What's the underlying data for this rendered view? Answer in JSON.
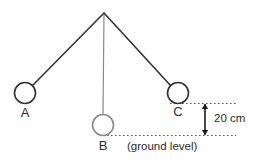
{
  "figure": {
    "background_color": "#ffffff",
    "width": 259,
    "height": 165
  },
  "pivot": {
    "name": "pivot-point",
    "x": 104,
    "y": 13
  },
  "balls": [
    {
      "id": "A",
      "label": "A",
      "cx": 25,
      "cy": 93,
      "r": 10.5,
      "stroke_color": "#333333",
      "fill_color": "#ffffff",
      "label_x": 25,
      "label_y": 114
    },
    {
      "id": "B",
      "label": "B",
      "cx": 103,
      "cy": 125,
      "r": 10.5,
      "stroke_color": "#8a8a8a",
      "fill_color": "#ffffff",
      "label_x": 103,
      "label_y": 147
    },
    {
      "id": "C",
      "label": "C",
      "cx": 178,
      "cy": 93,
      "r": 10.5,
      "stroke_color": "#333333",
      "fill_color": "#ffffff",
      "label_x": 178,
      "label_y": 113
    }
  ],
  "strings": [
    {
      "id": "string-to-A",
      "x1": 104,
      "y1": 13,
      "x2": 32.5,
      "y2": 85.5,
      "stroke_color": "#333333",
      "stroke_width": 1.6
    },
    {
      "id": "string-to-B",
      "x1": 104,
      "y1": 13,
      "x2": 103,
      "y2": 114.5,
      "stroke_color": "#8a8a8a",
      "stroke_width": 1.2
    },
    {
      "id": "string-to-C",
      "x1": 104,
      "y1": 13,
      "x2": 170.5,
      "y2": 85.5,
      "stroke_color": "#333333",
      "stroke_width": 1.6
    }
  ],
  "guides": [
    {
      "id": "level-line-c",
      "description": "dotted horizontal line at bottom of ball C",
      "x1": 170,
      "x2": 236,
      "y": 103.5,
      "stroke_color": "#555555",
      "dash": "1.6 2.4"
    },
    {
      "id": "ground-level-line",
      "description": "dotted horizontal line at bottom of ball B (ground level)",
      "x1": 107,
      "x2": 236,
      "y": 135.5,
      "stroke_color": "#555555",
      "dash": "1.6 2.4"
    }
  ],
  "dimension": {
    "id": "height-dimension",
    "value_label": "20 cm",
    "label_x": 214,
    "label_y": 119,
    "arrow_x": 205,
    "arrow_top_y": 104,
    "arrow_bottom_y": 135,
    "stroke_color": "#1a1a1a"
  },
  "annotations": [
    {
      "id": "ground-level-caption",
      "text": "(ground level)",
      "x": 127,
      "y": 147,
      "anchor": "start",
      "color": "#2b2b2b"
    }
  ]
}
